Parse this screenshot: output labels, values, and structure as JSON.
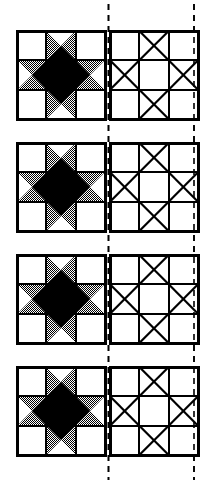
{
  "figure": {
    "title": "Quilt Block Construction Diagram",
    "background_color": "#ffffff",
    "ink_color": "#000000",
    "shade_color": "#7d7d7d",
    "white_color": "#ffffff",
    "row_count": 4,
    "columns": 2
  },
  "geometry": {
    "canvas_width": 212,
    "canvas_height": 484,
    "block_size": 88,
    "cell_size": 29.333,
    "left_block_x": 17,
    "right_block_x": 110,
    "row_y": [
      31,
      143,
      255,
      367
    ],
    "stroke_outer": 3,
    "stroke_inner": 2.2,
    "dash_line_x_left": 108.5,
    "dash_line_x_right": 194,
    "dash_pattern": "6 5",
    "dash_width": 1.6
  },
  "blocks": {
    "shaded": {
      "name": "Ohio Star shaded block",
      "grid": "3x3",
      "center_fill": "black",
      "corner_fill": "white",
      "edge_unit": "quarter-square-triangle",
      "edge_outer_triangle": "white",
      "edge_side_triangles": "shaded",
      "edge_inner_triangle": "black"
    },
    "template": {
      "name": "Ohio Star template line drawing",
      "grid": "3x3",
      "center_fill": "white",
      "corner_fill": "white",
      "edge_unit": "quarter-square-triangle",
      "all_fills": "white",
      "seam_lines": "diagonal X in each edge unit"
    }
  },
  "rows": [
    {
      "index": 1,
      "label": "Row 1",
      "left_block": "shaded",
      "right_block": "template"
    },
    {
      "index": 2,
      "label": "Row 2",
      "left_block": "shaded",
      "right_block": "template"
    },
    {
      "index": 3,
      "label": "Row 3",
      "left_block": "shaded",
      "right_block": "template"
    },
    {
      "index": 4,
      "label": "Row 4",
      "left_block": "shaded",
      "right_block": "template"
    }
  ],
  "guides": [
    {
      "name": "left-alignment-guide",
      "orientation": "vertical",
      "style": "dashed",
      "x": 108.5
    },
    {
      "name": "right-alignment-guide",
      "orientation": "vertical",
      "style": "dashed",
      "x": 194
    }
  ]
}
